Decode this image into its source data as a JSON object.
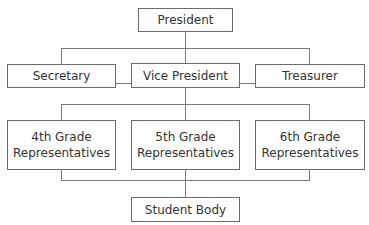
{
  "diagram": {
    "type": "org-chart",
    "cutoff_heading": "",
    "nodes": {
      "president": "President",
      "secretary": "Secretary",
      "vice_president": "Vice President",
      "treasurer": "Treasurer",
      "grade4_line1": "4th Grade",
      "grade4_line2": "Representatives",
      "grade5_line1": "5th Grade",
      "grade5_line2": "Representatives",
      "grade6_line1": "6th Grade",
      "grade6_line2": "Representatives",
      "student_body": "Student Body"
    },
    "edges": [
      [
        "President",
        "Secretary"
      ],
      [
        "President",
        "Vice President"
      ],
      [
        "President",
        "Treasurer"
      ],
      [
        "Secretary",
        "Vice President"
      ],
      [
        "Vice President",
        "Treasurer"
      ],
      [
        "Vice President",
        "4th Grade Representatives"
      ],
      [
        "Vice President",
        "5th Grade Representatives"
      ],
      [
        "Vice President",
        "6th Grade Representatives"
      ],
      [
        "4th Grade Representatives",
        "Student Body"
      ],
      [
        "5th Grade Representatives",
        "Student Body"
      ],
      [
        "6th Grade Representatives",
        "Student Body"
      ]
    ],
    "colors": {
      "box_border": "#6b6b6b",
      "line": "#7a7a7a",
      "text": "#333333",
      "background": "#ffffff"
    }
  }
}
